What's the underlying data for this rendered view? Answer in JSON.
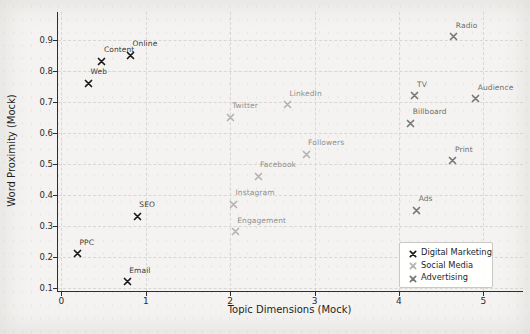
{
  "chart_data": {
    "type": "scatter",
    "title": "",
    "xlabel": "Topic Dimensions (Mock)",
    "ylabel": "Word Proximity (Mock)",
    "xlim": [
      -0.04,
      5.47
    ],
    "ylim": [
      0.09,
      0.99
    ],
    "grid": true,
    "marker": "x",
    "legend_position": "lower right",
    "xticks": {
      "values": [
        0,
        1,
        2,
        3,
        4,
        5
      ],
      "labels": [
        "0",
        "1",
        "2",
        "3",
        "4",
        "5"
      ]
    },
    "yticks": {
      "values": [
        0.1,
        0.2,
        0.3,
        0.4,
        0.5,
        0.6,
        0.7,
        0.8,
        0.9
      ],
      "labels": [
        "0.1",
        "0.2",
        "0.3",
        "0.4",
        "0.5",
        "0.6",
        "0.7",
        "0.8",
        "0.9"
      ]
    },
    "series": [
      {
        "name": "Digital Marketing",
        "color": "#1a1a1a",
        "label_color": "#3a3a3a",
        "points": [
          {
            "label": "Web",
            "x": 0.32,
            "y": 0.78
          },
          {
            "label": "Content",
            "x": 0.48,
            "y": 0.85
          },
          {
            "label": "Online",
            "x": 0.82,
            "y": 0.87
          },
          {
            "label": "SEO",
            "x": 0.9,
            "y": 0.35
          },
          {
            "label": "PPC",
            "x": 0.19,
            "y": 0.23
          },
          {
            "label": "Email",
            "x": 0.78,
            "y": 0.14
          }
        ]
      },
      {
        "name": "Social Media",
        "color": "#b5b4b2",
        "label_color": "#8f8e8c",
        "points": [
          {
            "label": "Twitter",
            "x": 2.0,
            "y": 0.67
          },
          {
            "label": "LinkedIn",
            "x": 2.68,
            "y": 0.71
          },
          {
            "label": "Followers",
            "x": 2.9,
            "y": 0.55
          },
          {
            "label": "Facebook",
            "x": 2.33,
            "y": 0.48
          },
          {
            "label": "Instagram",
            "x": 2.04,
            "y": 0.39
          },
          {
            "label": "Engagement",
            "x": 2.06,
            "y": 0.3
          }
        ]
      },
      {
        "name": "Advertising",
        "color": "#787776",
        "label_color": "#6e6d6c",
        "points": [
          {
            "label": "Radio",
            "x": 4.65,
            "y": 0.93
          },
          {
            "label": "TV",
            "x": 4.19,
            "y": 0.74
          },
          {
            "label": "Audience",
            "x": 4.91,
            "y": 0.73
          },
          {
            "label": "Billboard",
            "x": 4.14,
            "y": 0.65
          },
          {
            "label": "Print",
            "x": 4.64,
            "y": 0.53
          },
          {
            "label": "Ads",
            "x": 4.21,
            "y": 0.37
          }
        ]
      }
    ]
  }
}
